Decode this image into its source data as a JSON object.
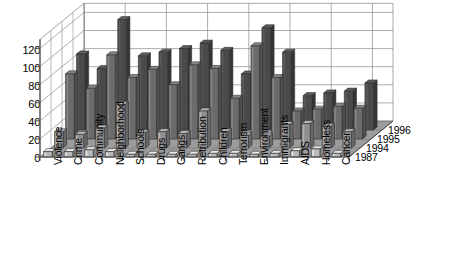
{
  "chart_data": {
    "type": "bar",
    "title": "",
    "subtitle": "",
    "xlabel": "",
    "ylabel": "",
    "zlabel": "",
    "projection": "3d",
    "grid": true,
    "legend_position": "depth-axis-right",
    "ylim": [
      0,
      130
    ],
    "yticks": [
      0,
      20,
      40,
      60,
      80,
      100,
      120
    ],
    "categories": [
      "Violence",
      "Crime",
      "Community",
      "Neighborhood",
      "Schools",
      "Drugs",
      "Gangs",
      "Retribution",
      "Children",
      "Terrorism",
      "Environment",
      "Immigrants",
      "AIDS",
      "Homeless",
      "Cancer"
    ],
    "depth_categories": [
      "1987",
      "1994",
      "1995",
      "1996"
    ],
    "series": [
      {
        "name": "1987",
        "values": [
          6,
          6,
          8,
          6,
          3,
          3,
          3,
          3,
          4,
          4,
          3,
          4,
          7,
          9,
          4
        ]
      },
      {
        "name": "1994",
        "values": [
          18,
          15,
          22,
          48,
          17,
          18,
          16,
          41,
          18,
          14,
          13,
          26,
          27,
          24,
          18
        ]
      },
      {
        "name": "1995",
        "values": [
          72,
          56,
          93,
          68,
          77,
          60,
          82,
          78,
          45,
          103,
          68,
          31,
          33,
          36,
          34
        ]
      },
      {
        "name": "1996",
        "values": [
          84,
          68,
          122,
          82,
          86,
          90,
          96,
          88,
          62,
          113,
          86,
          38,
          41,
          43,
          52
        ]
      }
    ]
  },
  "colors": {
    "bar_1987": "#b9b9b9",
    "bar_1994": "#8f8f8f",
    "bar_1995": "#6b6b6b",
    "bar_1996": "#4a4a4a",
    "floor": "#9c9c9c",
    "grid": "#8a8a8a",
    "axis": "#555555",
    "background": "#ffffff",
    "text": "#000000"
  }
}
